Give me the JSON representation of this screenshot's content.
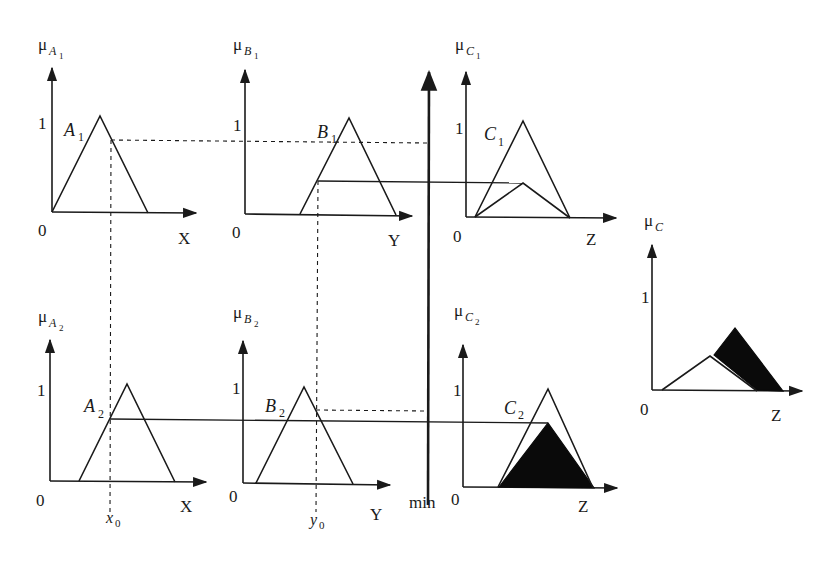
{
  "diagram": {
    "panels": {
      "A1": {
        "axis_label_mu": "μ",
        "axis_sub": "A",
        "axis_sub_index": "1",
        "set_name": "A",
        "set_index": "1",
        "one": "1",
        "origin": "0",
        "x_axis": "X"
      },
      "B1": {
        "axis_label_mu": "μ",
        "axis_sub": "B",
        "axis_sub_index": "1",
        "set_name": "B",
        "set_index": "1",
        "one": "1",
        "origin": "0",
        "x_axis": "Y"
      },
      "C1": {
        "axis_label_mu": "μ",
        "axis_sub": "C",
        "axis_sub_index": "1",
        "set_name": "C",
        "set_index": "1",
        "one": "1",
        "origin": "0",
        "x_axis": "Z"
      },
      "A2": {
        "axis_label_mu": "μ",
        "axis_sub": "A",
        "axis_sub_index": "2",
        "set_name": "A",
        "set_index": "2",
        "one": "1",
        "origin": "0",
        "x_axis": "X"
      },
      "B2": {
        "axis_label_mu": "μ",
        "axis_sub": "B",
        "axis_sub_index": "2",
        "set_name": "B",
        "set_index": "2",
        "one": "1",
        "origin": "0",
        "x_axis": "Y"
      },
      "C2": {
        "axis_label_mu": "μ",
        "axis_sub": "C",
        "axis_sub_index": "2",
        "set_name": "C",
        "set_index": "2",
        "one": "1",
        "origin": "0",
        "x_axis": "Z"
      },
      "C": {
        "axis_label_mu": "μ",
        "axis_sub": "C",
        "one": "1",
        "origin": "0",
        "x_axis": "Z"
      }
    },
    "inputs": {
      "x0_var": "x",
      "x0_sub": "0",
      "y0_var": "y",
      "y0_sub": "0"
    },
    "operator_label": "min",
    "colors": {
      "line": "#1a1a1a",
      "fill": "#0a0a0a",
      "background": "#ffffff"
    }
  }
}
